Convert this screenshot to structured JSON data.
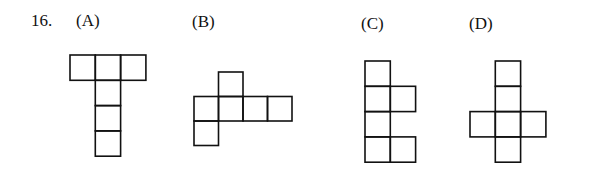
{
  "question": {
    "number": "16.",
    "options": [
      {
        "label": "(A)",
        "cells": [
          [
            0,
            0
          ],
          [
            1,
            0
          ],
          [
            2,
            0
          ],
          [
            1,
            1
          ],
          [
            1,
            2
          ],
          [
            1,
            3
          ]
        ]
      },
      {
        "label": "(B)",
        "cells": [
          [
            1,
            0
          ],
          [
            0,
            1
          ],
          [
            1,
            1
          ],
          [
            2,
            1
          ],
          [
            3,
            1
          ],
          [
            0,
            2
          ]
        ]
      },
      {
        "label": "(C)",
        "cells": [
          [
            0,
            0
          ],
          [
            0,
            1
          ],
          [
            1,
            1
          ],
          [
            0,
            2
          ],
          [
            0,
            3
          ],
          [
            1,
            3
          ]
        ]
      },
      {
        "label": "(D)",
        "cells": [
          [
            1,
            0
          ],
          [
            1,
            1
          ],
          [
            0,
            2
          ],
          [
            1,
            2
          ],
          [
            2,
            2
          ],
          [
            1,
            3
          ]
        ]
      }
    ]
  }
}
